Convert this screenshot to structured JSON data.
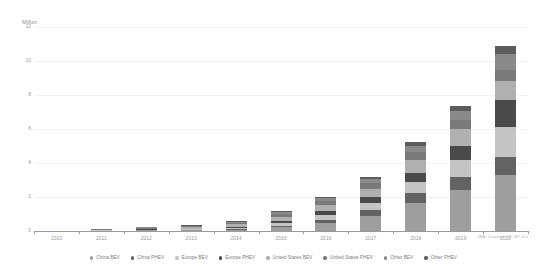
{
  "axis": {
    "unit_label": "Million",
    "y_ticks": [
      "0",
      "2",
      "4",
      "6",
      "8",
      "10",
      "12"
    ],
    "x_labels": [
      "2010",
      "2011",
      "2012",
      "2013",
      "2014",
      "2015",
      "2016",
      "2017",
      "2018",
      "2019",
      "2020"
    ]
  },
  "attribution": "IEA. Licence: CC BY 4.0",
  "legend": {
    "items": [
      {
        "label": "China BEV",
        "color": "#9e9e9e"
      },
      {
        "label": "China PHEV",
        "color": "#636363"
      },
      {
        "label": "Europe BEV",
        "color": "#c4c4c4"
      },
      {
        "label": "Europe PHEV",
        "color": "#4a4a4a"
      },
      {
        "label": "United States BEV",
        "color": "#b0b0b0"
      },
      {
        "label": "United States PHEV",
        "color": "#7a7a7a"
      },
      {
        "label": "Other BEV",
        "color": "#8a8a8a"
      },
      {
        "label": "Other PHEV",
        "color": "#5c5c5c"
      }
    ]
  },
  "chart_data": {
    "type": "bar",
    "stacked": true,
    "title": "",
    "subtitle": "",
    "xlabel": "",
    "ylabel": "Million",
    "ylim": [
      0,
      12
    ],
    "ytick_step": 2,
    "grid": true,
    "legend_position": "bottom",
    "categories": [
      "2010",
      "2011",
      "2012",
      "2013",
      "2014",
      "2015",
      "2016",
      "2017",
      "2018",
      "2019",
      "2020"
    ],
    "series": [
      {
        "name": "China BEV",
        "color": "#9e9e9e",
        "values": [
          0.0,
          0.0,
          0.01,
          0.02,
          0.07,
          0.23,
          0.5,
          0.91,
          1.67,
          2.4,
          3.3
        ]
      },
      {
        "name": "China PHEV",
        "color": "#636363",
        "values": [
          0.0,
          0.0,
          0.0,
          0.01,
          0.03,
          0.08,
          0.17,
          0.31,
          0.56,
          0.8,
          1.05
        ]
      },
      {
        "name": "Europe BEV",
        "color": "#c4c4c4",
        "values": [
          0.0,
          0.01,
          0.02,
          0.04,
          0.09,
          0.17,
          0.28,
          0.42,
          0.63,
          0.95,
          1.75
        ]
      },
      {
        "name": "Europe PHEV",
        "color": "#4a4a4a",
        "values": [
          0.0,
          0.0,
          0.01,
          0.02,
          0.06,
          0.13,
          0.24,
          0.38,
          0.58,
          0.85,
          1.6
        ]
      },
      {
        "name": "United States BEV",
        "color": "#b0b0b0",
        "values": [
          0.0,
          0.01,
          0.03,
          0.08,
          0.14,
          0.24,
          0.34,
          0.48,
          0.75,
          0.98,
          1.15
        ]
      },
      {
        "name": "United States PHEV",
        "color": "#7a7a7a",
        "values": [
          0.0,
          0.01,
          0.02,
          0.05,
          0.1,
          0.17,
          0.24,
          0.33,
          0.45,
          0.55,
          0.6
        ]
      },
      {
        "name": "Other BEV",
        "color": "#8a8a8a",
        "values": [
          0.0,
          0.01,
          0.02,
          0.03,
          0.06,
          0.1,
          0.16,
          0.24,
          0.37,
          0.55,
          0.95
        ]
      },
      {
        "name": "Other PHEV",
        "color": "#5c5c5c",
        "values": [
          0.0,
          0.0,
          0.01,
          0.01,
          0.03,
          0.05,
          0.08,
          0.13,
          0.21,
          0.3,
          0.5
        ]
      }
    ],
    "totals": [
      0.0,
      0.04,
      0.12,
      0.26,
      0.58,
      1.17,
      2.01,
      3.2,
      5.22,
      7.38,
      10.9
    ]
  }
}
